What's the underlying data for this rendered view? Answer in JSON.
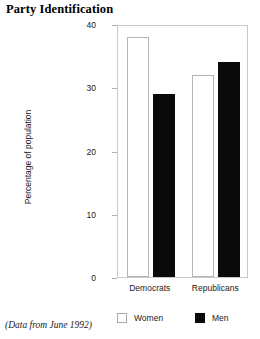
{
  "chart_data": {
    "type": "bar",
    "title": "Party Identification",
    "xlabel": "",
    "ylabel": "Percentage of population",
    "categories": [
      "Democrats",
      "Republicans"
    ],
    "series": [
      {
        "name": "Women",
        "values": [
          38,
          32
        ],
        "color": "#ffffff"
      },
      {
        "name": "Men",
        "values": [
          29,
          34
        ],
        "color": "#000000"
      }
    ],
    "ylim": [
      0,
      40
    ],
    "yticks": [
      0,
      10,
      20,
      30,
      40
    ],
    "ytick_labels": [
      "0",
      "10",
      "20",
      "30",
      "40"
    ],
    "grid": false,
    "legend_position": "bottom",
    "annotation": "(Data from June 1992)"
  },
  "legend": {
    "entries": [
      {
        "label": "Women",
        "swatch": "white-square"
      },
      {
        "label": "Men",
        "swatch": "black-square"
      }
    ]
  },
  "footnote": {
    "text": "(Data from June 1992)"
  }
}
